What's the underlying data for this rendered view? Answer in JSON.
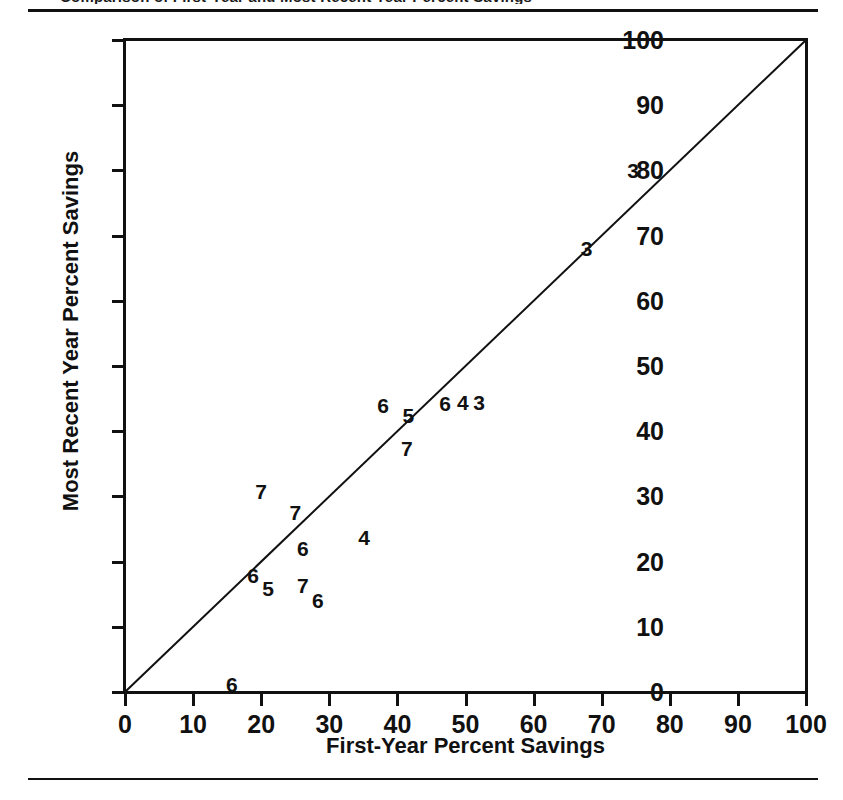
{
  "figure": {
    "title_clipped": "Comparison of First-Year and Most Recent Year Percent Savings",
    "rule_color": "#111111"
  },
  "chart_data": {
    "type": "scatter",
    "title": "",
    "xlabel": "First-Year Percent Savings",
    "ylabel": "Most Recent Year Percent Savings",
    "xlim": [
      0,
      100
    ],
    "ylim": [
      0,
      100
    ],
    "xticks": [
      0,
      10,
      20,
      30,
      40,
      50,
      60,
      70,
      80,
      90,
      100
    ],
    "yticks": [
      0,
      10,
      20,
      30,
      40,
      50,
      60,
      70,
      80,
      90,
      100
    ],
    "grid": false,
    "legend": "none",
    "marker_style": "digit-label",
    "annotations": [
      {
        "text": "45-degree reference line from (0,0) to (100,100)"
      }
    ],
    "reference_line": {
      "from": [
        0,
        0
      ],
      "to": [
        100,
        100
      ]
    },
    "points": [
      {
        "label": "3",
        "x": 74.6,
        "y": 80.1
      },
      {
        "label": "3",
        "x": 67.8,
        "y": 68.1
      },
      {
        "label": "6",
        "x": 37.9,
        "y": 44.0
      },
      {
        "label": "5",
        "x": 41.6,
        "y": 42.5
      },
      {
        "label": "6",
        "x": 47.0,
        "y": 44.3
      },
      {
        "label": "4",
        "x": 49.6,
        "y": 44.5
      },
      {
        "label": "3",
        "x": 52.0,
        "y": 44.5
      },
      {
        "label": "7",
        "x": 41.4,
        "y": 37.4
      },
      {
        "label": "7",
        "x": 20.0,
        "y": 30.8
      },
      {
        "label": "7",
        "x": 25.0,
        "y": 27.6
      },
      {
        "label": "6",
        "x": 26.1,
        "y": 22.1
      },
      {
        "label": "4",
        "x": 35.1,
        "y": 23.8
      },
      {
        "label": "6",
        "x": 18.8,
        "y": 18.0
      },
      {
        "label": "5",
        "x": 21.0,
        "y": 16.0
      },
      {
        "label": "7",
        "x": 26.1,
        "y": 16.4
      },
      {
        "label": "6",
        "x": 28.3,
        "y": 14.1
      },
      {
        "label": "6",
        "x": 15.7,
        "y": 1.2
      }
    ]
  }
}
